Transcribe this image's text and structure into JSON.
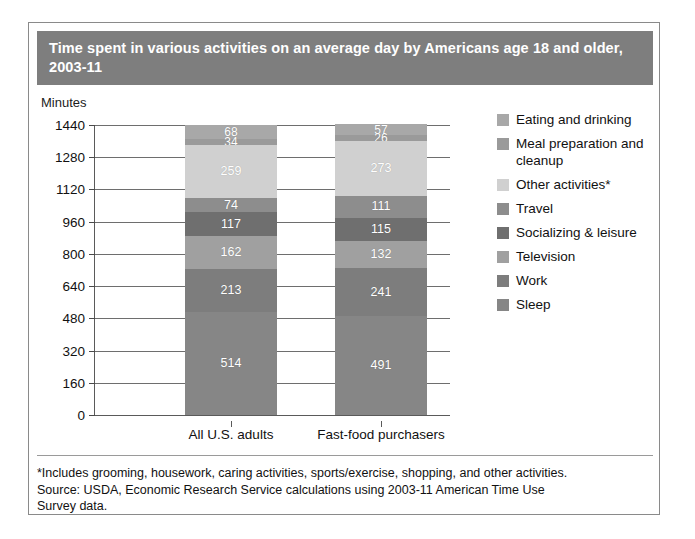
{
  "title": "Time spent in various activities on an average day by Americans age 18 and older, 2003-11",
  "y_axis_title": "Minutes",
  "footnote": {
    "line1": "*Includes grooming, housework, caring activities, sports/exercise, shopping, and other activities.",
    "line2": "Source: USDA, Economic Research Service calculations using 2003-11 American Time Use",
    "line3": "Survey data."
  },
  "colors": {
    "title_banner": "#7e7e7e",
    "eating_and_drinking": "#a8a8a8",
    "meal_preparation_and_cleanup": "#9a9a9a",
    "other_activities": "#d0d0d0",
    "travel": "#8d8d8d",
    "socializing_and_leisure": "#6f6f6f",
    "television": "#a0a0a0",
    "work": "#7d7d7d",
    "sleep": "#868686"
  },
  "legend": {
    "items": [
      {
        "label": "Eating and drinking",
        "color": "#a8a8a8"
      },
      {
        "label": "Meal preparation and cleanup",
        "color": "#9a9a9a"
      },
      {
        "label": "Other activities*",
        "color": "#d0d0d0"
      },
      {
        "label": "Travel",
        "color": "#8d8d8d"
      },
      {
        "label": "Socializing & leisure",
        "color": "#6f6f6f"
      },
      {
        "label": "Television",
        "color": "#a0a0a0"
      },
      {
        "label": "Work",
        "color": "#7d7d7d"
      },
      {
        "label": "Sleep",
        "color": "#868686"
      }
    ]
  },
  "chart_data": {
    "type": "bar",
    "subtype": "stacked",
    "title": "Time spent in various activities on an average day by Americans age 18 and older, 2003-11",
    "xlabel": "",
    "ylabel": "Minutes",
    "ylim": [
      0,
      1440
    ],
    "yticks": [
      0,
      160,
      320,
      480,
      640,
      800,
      960,
      1120,
      1280,
      1440
    ],
    "grid": true,
    "legend_position": "right",
    "categories": [
      "All U.S. adults",
      "Fast-food purchasers"
    ],
    "series": [
      {
        "name": "Sleep",
        "color": "#868686",
        "values": [
          514,
          491
        ]
      },
      {
        "name": "Work",
        "color": "#7d7d7d",
        "values": [
          213,
          241
        ]
      },
      {
        "name": "Television",
        "color": "#a0a0a0",
        "values": [
          162,
          132
        ]
      },
      {
        "name": "Socializing & leisure",
        "color": "#6f6f6f",
        "values": [
          117,
          115
        ]
      },
      {
        "name": "Travel",
        "color": "#8d8d8d",
        "values": [
          74,
          111
        ]
      },
      {
        "name": "Other activities*",
        "color": "#d0d0d0",
        "values": [
          259,
          273
        ]
      },
      {
        "name": "Meal preparation and cleanup",
        "color": "#9a9a9a",
        "values": [
          34,
          26
        ]
      },
      {
        "name": "Eating and drinking",
        "color": "#a8a8a8",
        "values": [
          68,
          57
        ]
      }
    ],
    "totals": [
      1441,
      1446
    ]
  },
  "bars": [
    {
      "category": "All U.S. adults",
      "segments": [
        {
          "name": "Sleep",
          "value": 514,
          "label": "514",
          "color": "#868686"
        },
        {
          "name": "Work",
          "value": 213,
          "label": "213",
          "color": "#7d7d7d"
        },
        {
          "name": "Television",
          "value": 162,
          "label": "162",
          "color": "#a0a0a0"
        },
        {
          "name": "Socializing & leisure",
          "value": 117,
          "label": "117",
          "color": "#6f6f6f"
        },
        {
          "name": "Travel",
          "value": 74,
          "label": "74",
          "color": "#8d8d8d"
        },
        {
          "name": "Other activities*",
          "value": 259,
          "label": "259",
          "color": "#d0d0d0"
        },
        {
          "name": "Meal preparation and cleanup",
          "value": 34,
          "label": "34",
          "color": "#9a9a9a"
        },
        {
          "name": "Eating and drinking",
          "value": 68,
          "label": "68",
          "color": "#a8a8a8"
        }
      ]
    },
    {
      "category": "Fast-food purchasers",
      "segments": [
        {
          "name": "Sleep",
          "value": 491,
          "label": "491",
          "color": "#868686"
        },
        {
          "name": "Work",
          "value": 241,
          "label": "241",
          "color": "#7d7d7d"
        },
        {
          "name": "Television",
          "value": 132,
          "label": "132",
          "color": "#a0a0a0"
        },
        {
          "name": "Socializing & leisure",
          "value": 115,
          "label": "115",
          "color": "#6f6f6f"
        },
        {
          "name": "Travel",
          "value": 111,
          "label": "111",
          "color": "#8d8d8d"
        },
        {
          "name": "Other activities*",
          "value": 273,
          "label": "273",
          "color": "#d0d0d0"
        },
        {
          "name": "Meal preparation and cleanup",
          "value": 26,
          "label": "26",
          "color": "#9a9a9a"
        },
        {
          "name": "Eating and drinking",
          "value": 57,
          "label": "57",
          "color": "#a8a8a8"
        }
      ]
    }
  ]
}
